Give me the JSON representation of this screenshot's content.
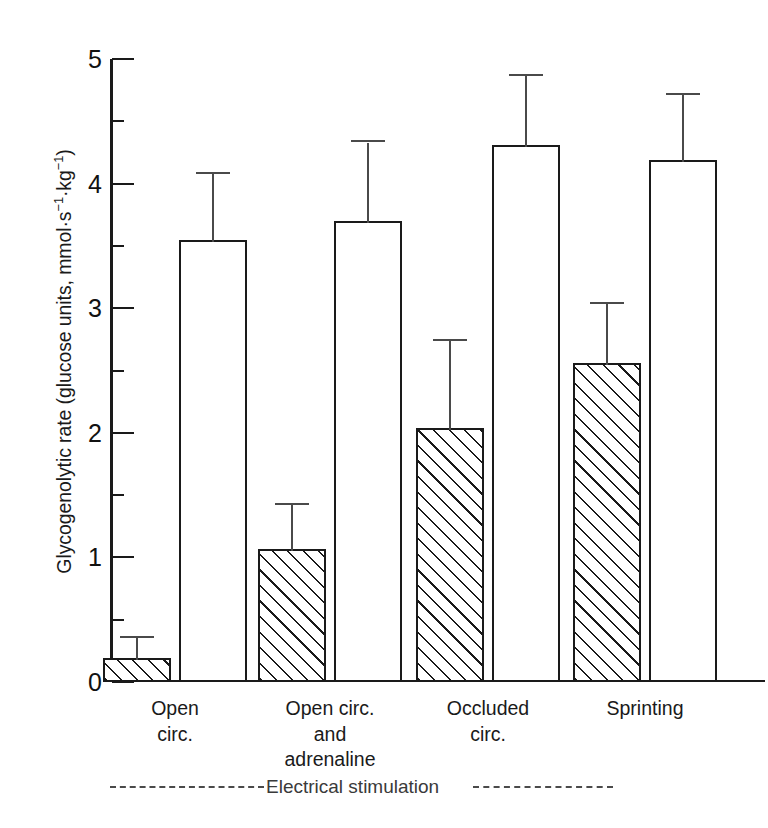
{
  "chart_data": {
    "type": "bar",
    "title": "",
    "xlabel": "",
    "ylabel": "Glycogenolytic rate (glucose units, mmol·s⁻¹·kg⁻¹)",
    "ylabel_parts": {
      "prefix": "Glycogenolytic rate (glucose units, mmol·s",
      "exp1": "−1",
      "mid": "·kg",
      "exp2": "−1",
      "suffix": ")"
    },
    "ylim": [
      0,
      5
    ],
    "ytick_labels": [
      "0",
      "1",
      "2",
      "3",
      "4",
      "5"
    ],
    "ytick_values": [
      0,
      1,
      2,
      3,
      4,
      5
    ],
    "yminor_values": [
      0.5,
      1.5,
      2.5,
      3.5,
      4.5
    ],
    "grid": false,
    "legend": "none",
    "categories": [
      "Open circ.",
      "Open circ. and adrenaline",
      "Occluded circ.",
      "Sprinting"
    ],
    "category_lines": [
      [
        "Open",
        "circ."
      ],
      [
        "Open circ.",
        "and",
        "adrenaline"
      ],
      [
        "Occluded",
        "circ."
      ],
      [
        "Sprinting"
      ]
    ],
    "bars": [
      {
        "category": "Open circ.",
        "fill": "hatched",
        "value": 0.19,
        "error": 0.16
      },
      {
        "category": "Open circ.",
        "fill": "white",
        "value": 3.55,
        "error": 0.53
      },
      {
        "category": "Open circ. and adrenaline",
        "fill": "hatched",
        "value": 1.07,
        "error": 0.35
      },
      {
        "category": "Open circ. and adrenaline",
        "fill": "white",
        "value": 3.7,
        "error": 0.63
      },
      {
        "category": "Occluded circ.",
        "fill": "hatched",
        "value": 2.04,
        "error": 0.7
      },
      {
        "category": "Occluded circ.",
        "fill": "white",
        "value": 4.31,
        "error": 0.55
      },
      {
        "category": "Sprinting",
        "fill": "hatched",
        "value": 2.56,
        "error": 0.47
      },
      {
        "category": "Sprinting",
        "fill": "white",
        "value": 4.19,
        "error": 0.52
      }
    ],
    "annotations": [
      {
        "name": "electrical-stimulation-bracket",
        "text": "Electrical stimulation"
      }
    ]
  },
  "colors": {
    "ink": "#1a1a1a",
    "error": "#4a4a4a",
    "background": "#ffffff",
    "annotation": "#3a3a3a"
  }
}
